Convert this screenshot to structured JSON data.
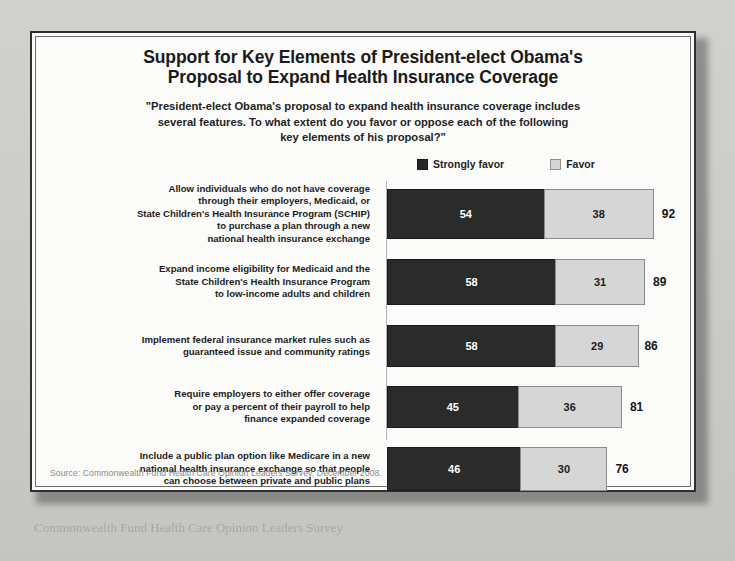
{
  "figure": {
    "title_line1": "Support for Key Elements of President-elect Obama's",
    "title_line2": "Proposal to Expand Health Insurance Coverage",
    "subtitle_line1": "\"President-elect Obama's proposal to expand health insurance coverage includes",
    "subtitle_line2": "several features. To what extent do you favor or oppose each of the following",
    "subtitle_line3": "key elements of his proposal?\"",
    "source": "Source: Commonwealth Fund Health Care Opinion Leaders Survey, December 2008.",
    "legend": [
      {
        "label": "Strongly favor",
        "swatch": "dark-square-icon",
        "color": "#2b2b2b"
      },
      {
        "label": "Favor",
        "swatch": "light-square-icon",
        "color": "#d6d6d6"
      }
    ]
  },
  "chart_data": {
    "type": "bar",
    "orientation": "horizontal",
    "stacked": true,
    "title": "Support for Key Elements of President-elect Obama's Proposal to Expand Health Insurance Coverage",
    "subtitle": "\"President-elect Obama's proposal to expand health insurance coverage includes several features. To what extent do you favor or oppose each of the following key elements of his proposal?\"",
    "xlabel": "",
    "ylabel": "",
    "xlim": [
      0,
      100
    ],
    "grid": false,
    "legend_position": "top-right",
    "categories": [
      "Allow individuals who do not have coverage through their employers, Medicaid, or State Children's Health Insurance Program (SCHIP) to purchase a plan through a new national health insurance exchange",
      "Expand income eligibility for Medicaid and the State Children's Health Insurance Program to low-income adults and children",
      "Implement federal insurance market rules such as guaranteed issue and community ratings",
      "Require employers to either offer coverage or pay a percent of their payroll to help finance expanded coverage",
      "Include a public plan option like Medicare in a new national health insurance exchange so that people can choose between private and public plans"
    ],
    "category_lines": [
      [
        "Allow individuals who do not have coverage",
        "through their employers, Medicaid, or",
        "State Children's Health Insurance Program (SCHIP)",
        "to purchase a plan through a new",
        "national health insurance exchange"
      ],
      [
        "Expand income eligibility for Medicaid and the",
        "State Children's Health Insurance Program",
        "to low-income adults and children"
      ],
      [
        "Implement federal insurance market rules such as",
        "guaranteed issue and community ratings"
      ],
      [
        "Require employers to either offer coverage",
        "or pay a percent of their payroll to help",
        "finance expanded coverage"
      ],
      [
        "Include a public plan option like Medicare in a new",
        "national health insurance exchange so that people",
        "can choose between private and public plans"
      ]
    ],
    "series": [
      {
        "name": "Strongly favor",
        "values": [
          54,
          58,
          58,
          45,
          46
        ],
        "color": "#2b2b2b"
      },
      {
        "name": "Favor",
        "values": [
          38,
          31,
          29,
          36,
          30
        ],
        "color": "#d6d6d6"
      }
    ],
    "totals": [
      92,
      89,
      86,
      81,
      76
    ],
    "units": "percent"
  },
  "page_caption": "Commonwealth Fund Health Care Opinion Leaders Survey"
}
